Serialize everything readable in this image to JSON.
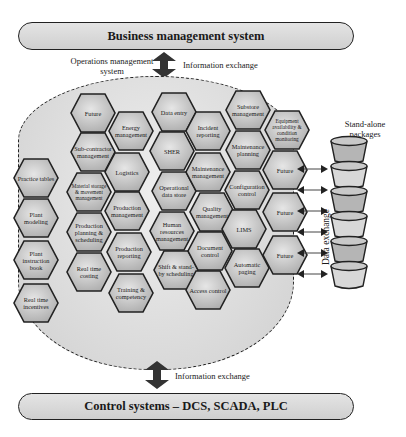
{
  "top_bar": {
    "label": "Business management system"
  },
  "bottom_bar": {
    "label": "Control systems – DCS, SCADA, PLC"
  },
  "labels": {
    "ops_system": "Operations management system",
    "info_top": "Information exchange",
    "info_bottom": "Information exchange",
    "standalone": "Stand-alone packages",
    "data_exchange": "Data exchange"
  },
  "hexes": [
    {
      "label": "Practice tables",
      "x": 36,
      "y": 178
    },
    {
      "label": "Plant modeling",
      "x": 36,
      "y": 218
    },
    {
      "label": "Plant instruction book",
      "x": 36,
      "y": 260
    },
    {
      "label": "Real time incentives",
      "x": 36,
      "y": 303
    },
    {
      "label": "Future",
      "x": 93,
      "y": 113
    },
    {
      "label": "Sub-contractor management",
      "x": 93,
      "y": 152
    },
    {
      "label": "Material storage & movement management",
      "x": 89,
      "y": 192,
      "small": true
    },
    {
      "label": "Production planning & scheduling",
      "x": 89,
      "y": 232
    },
    {
      "label": "Real time costing",
      "x": 89,
      "y": 272
    },
    {
      "label": "Energy management",
      "x": 131,
      "y": 131
    },
    {
      "label": "Logistics",
      "x": 127,
      "y": 172
    },
    {
      "label": "Production management",
      "x": 127,
      "y": 211
    },
    {
      "label": "Production reporting",
      "x": 129,
      "y": 252
    },
    {
      "label": "Training & competency",
      "x": 131,
      "y": 293
    },
    {
      "label": "Data entry",
      "x": 174,
      "y": 112
    },
    {
      "label": "SHER",
      "x": 172,
      "y": 151
    },
    {
      "label": "Operational data store",
      "x": 174,
      "y": 191
    },
    {
      "label": "Human resources management",
      "x": 172,
      "y": 231
    },
    {
      "label": "Shift & stand-by scheduling",
      "x": 176,
      "y": 270
    },
    {
      "label": "Incident reporting",
      "x": 208,
      "y": 131
    },
    {
      "label": "Maintenance management",
      "x": 208,
      "y": 172
    },
    {
      "label": "Quality management",
      "x": 212,
      "y": 212
    },
    {
      "label": "Document control",
      "x": 210,
      "y": 251
    },
    {
      "label": "Access control",
      "x": 208,
      "y": 290
    },
    {
      "label": "Substore management",
      "x": 248,
      "y": 110
    },
    {
      "label": "Maintenance planning",
      "x": 248,
      "y": 150
    },
    {
      "label": "Configuration control",
      "x": 247,
      "y": 190
    },
    {
      "label": "LIMS",
      "x": 244,
      "y": 229
    },
    {
      "label": "Automatic paging",
      "x": 247,
      "y": 268
    },
    {
      "label": "Equipment availability & condition monitoring",
      "x": 287,
      "y": 130,
      "small": true
    },
    {
      "label": "Future",
      "x": 285,
      "y": 170
    },
    {
      "label": "Future",
      "x": 285,
      "y": 212
    },
    {
      "label": "Future",
      "x": 285,
      "y": 255
    }
  ],
  "packages": {
    "count": 6
  },
  "data_arrows": {
    "count": 6
  }
}
